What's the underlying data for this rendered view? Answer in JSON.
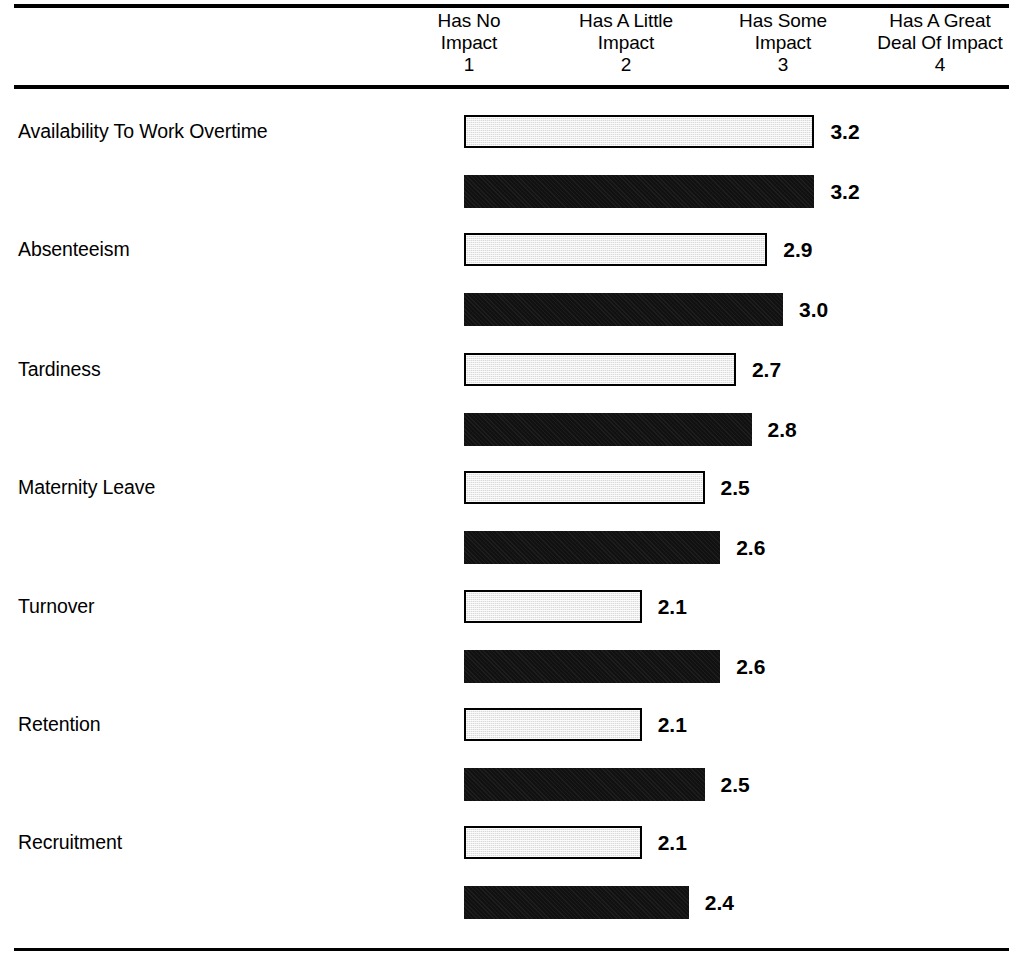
{
  "header": {
    "columns": [
      {
        "line1": "Has No",
        "line2": "Impact",
        "number": "1"
      },
      {
        "line1": "Has A Little",
        "line2": "Impact",
        "number": "2"
      },
      {
        "line1": "Has Some",
        "line2": "Impact",
        "number": "3"
      },
      {
        "line1": "Has A Great",
        "line2": "Deal Of Impact",
        "number": "4"
      }
    ]
  },
  "rows": [
    {
      "label": "Availability To Work Overtime",
      "light": "3.2",
      "dark": "3.2"
    },
    {
      "label": "Absenteeism",
      "light": "2.9",
      "dark": "3.0"
    },
    {
      "label": "Tardiness",
      "light": "2.7",
      "dark": "2.8"
    },
    {
      "label": "Maternity Leave",
      "light": "2.5",
      "dark": "2.6"
    },
    {
      "label": "Turnover",
      "light": "2.1",
      "dark": "2.6"
    },
    {
      "label": "Retention",
      "light": "2.1",
      "dark": "2.5"
    },
    {
      "label": "Recruitment",
      "light": "2.1",
      "dark": "2.4"
    }
  ],
  "colors": {
    "light_bar_fill": "#d9d9d9",
    "light_bar_border": "#000000",
    "dark_bar_fill": "#111111",
    "rule": "#000000",
    "text": "#000000"
  },
  "chart_data": {
    "type": "bar",
    "title": "",
    "subtitle": "",
    "xlabel": "",
    "ylabel": "",
    "orientation": "horizontal",
    "grid": false,
    "legend_position": "none",
    "xlim": [
      1,
      4
    ],
    "axis_ticks": [
      1,
      2,
      3,
      4
    ],
    "axis_tick_labels": [
      "Has No Impact",
      "Has A Little Impact",
      "Has Some Impact",
      "Has A Great Deal Of Impact"
    ],
    "categories": [
      "Availability To Work Overtime",
      "Absenteeism",
      "Tardiness",
      "Maternity Leave",
      "Turnover",
      "Retention",
      "Recruitment"
    ],
    "series": [
      {
        "name": "light",
        "values": [
          3.2,
          2.9,
          2.7,
          2.5,
          2.1,
          2.1,
          2.1
        ]
      },
      {
        "name": "dark",
        "values": [
          3.2,
          3.0,
          2.8,
          2.6,
          2.6,
          2.5,
          2.4
        ]
      }
    ]
  },
  "geometry": {
    "bar_origin_x": 312,
    "bar_start_x": 464,
    "px_per_unit": 157,
    "bar_height": 33,
    "row_tops": [
      115,
      233,
      353,
      471,
      590,
      708,
      826
    ],
    "pair_offset": 60,
    "value_gap": 16
  }
}
